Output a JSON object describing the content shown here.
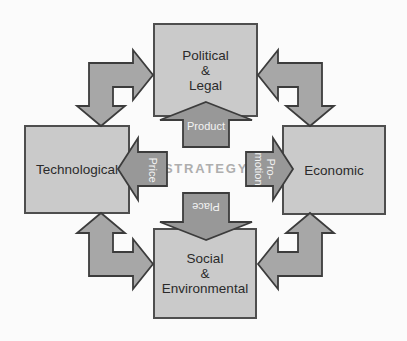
{
  "diagram": {
    "center_label": "STRATEGY",
    "boxes": {
      "political_legal": {
        "line1": "Political",
        "line2": "&",
        "line3": "Legal"
      },
      "technological": {
        "label": "Technological"
      },
      "economic": {
        "label": "Economic"
      },
      "social_environmental": {
        "line1": "Social",
        "line2": "&",
        "line3": "Environmental"
      }
    },
    "arrows": {
      "product": {
        "label": "Product",
        "direction": "up"
      },
      "price": {
        "label": "Price",
        "direction": "left"
      },
      "promotion": {
        "line1": "Pro-",
        "line2": "motion",
        "direction": "right"
      },
      "place": {
        "label": "Place",
        "direction": "down"
      }
    }
  },
  "colors": {
    "background": "#fbfbfb",
    "box_fill": "#cacaca",
    "box_border": "#4e4e4e",
    "box_text": "#2a2a2a",
    "arrow_fill": "#989898",
    "connector_fill": "#a7a7a7",
    "arrow_outline": "#3c3c3c",
    "arrow_text": "#f4f4f4",
    "strategy_text": "#aeaeae"
  }
}
